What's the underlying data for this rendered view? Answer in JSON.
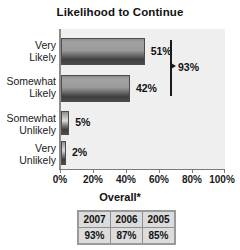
{
  "chart_data": {
    "type": "bar",
    "orientation": "horizontal",
    "title": "Likelihood to Continue",
    "xlabel": "",
    "ylabel": "",
    "categories": [
      "Very Likely",
      "Somewhat Likely",
      "Somewhat Unlikely",
      "Very Unlikely"
    ],
    "values": [
      51,
      42,
      5,
      2
    ],
    "value_labels": [
      "51%",
      "42%",
      "5%",
      "2%"
    ],
    "xlim": [
      0,
      100
    ],
    "xticks": [
      0,
      20,
      40,
      60,
      80,
      100
    ],
    "xtick_labels": [
      "0%",
      "20%",
      "40%",
      "60%",
      "80%",
      "100%"
    ],
    "grid": false,
    "legend": "none",
    "annotations": [
      {
        "text": "93%",
        "type": "bracket",
        "covers": [
          "Very Likely",
          "Somewhat Likely"
        ]
      }
    ],
    "footer_label": "Overall*",
    "table": {
      "headers": [
        "2007",
        "2006",
        "2005"
      ],
      "rows": [
        [
          "93%",
          "87%",
          "85%"
        ]
      ]
    },
    "colors": {
      "bar_fill": "#9a9a9a",
      "bar_edge": "#4c4c4c",
      "plot_background": "#efefef",
      "axis": "#7a7a7a",
      "text": "#111111",
      "table_background": "#dcdcdc",
      "table_border": "#9a9a9a"
    }
  },
  "category_lines": [
    [
      "Very",
      "Likely"
    ],
    [
      "Somewhat",
      "Likely"
    ],
    [
      "Somewhat",
      "Unlikely"
    ],
    [
      "Very",
      "Unlikely"
    ]
  ]
}
